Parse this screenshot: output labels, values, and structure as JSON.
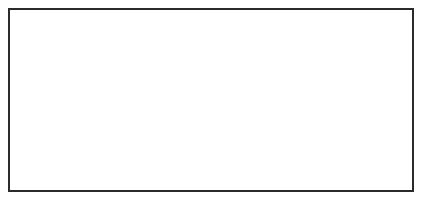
{
  "figure": {
    "background_color": "#ffffff",
    "frame": {
      "border_color": "#2b2b2b",
      "border_width_px": 2,
      "x": 8,
      "y": 8,
      "width": 406,
      "height": 184
    },
    "outline_color": "#2e2e2e",
    "fill_color": "#ffffff",
    "notch_color": "#1a1a1a",
    "label_color": "#3a3a3a",
    "panel_count": 4,
    "panels": [
      {
        "id": "panel-a",
        "label": "(a)",
        "label_x": 17,
        "label_y": 47,
        "upper_shape": {
          "name": "upper-valve-outline",
          "path": "M 63 41 C 68 45, 70 53, 70 62 C 70 72, 68 82, 66 88 C 64 93, 62 95, 59 97 C 56 99, 52 101, 49 103 C 46 105, 44 106, 42 106 C 39.5 106, 38.5 103.5, 39.5 99 C 40.5 94, 42.5 88, 44.5 81 C 46.5 74, 48.5 66, 51 58 C 53.5 50, 56 44, 58.5 41.5 C 60 40, 61.5 39.8, 63 41 Z"
        },
        "lower_shape": {
          "name": "lower-valve-outline",
          "path": "M 55 99 C 57.5 99.5, 60 101.5, 63 104.5 C 66 107.5, 69 111, 72 115 C 75 119, 78 124, 80.5 129 C 83 134, 85 139, 86 144 C 87 149, 87 153, 85.5 156 C 84 159, 81.5 159.5, 79.5 157.5 C 77 155, 74.5 150.5, 71.5 144.5 C 68.5 138.5, 65 131, 62 124 C 59 117, 56.5 110.5, 55 106 C 53.8 102.3, 53.5 99.6, 55 99 Z"
        },
        "notch": {
          "name": "hinge-notch",
          "path": "M 51 99.5 C 53.5 99, 55.5 100, 56.5 102 C 57.3 103.6, 56.6 105, 54.8 105.3 C 52.8 105.6, 51 104.4, 50.3 102.5 C 49.8 101, 50 99.8, 51 99.5 Z"
        }
      },
      {
        "id": "panel-b",
        "label": "(b)",
        "label_x": 118,
        "label_y": 46,
        "upper_shape": {
          "name": "upper-valve-outline",
          "path": "M 164 47 C 168 51, 169.5 58, 169 66 C 168.5 75, 166 84, 163.5 90 C 161.5 95, 159.5 98, 157 100.5 C 154 103.5, 150 106, 146 108.5 C 142.5 110.8, 139.5 112, 137 112 C 134.5 112, 133.5 109.5, 134.5 105.5 C 135.5 101, 138 95, 141 88 C 144.5 80, 148.5 71, 152.5 63 C 156.5 55, 160 49.5, 162 47.5 C 163 46.5, 163.6 46.4, 164 47 Z"
        },
        "lower_shape": {
          "name": "lower-valve-outline",
          "path": "M 149 105 C 152 105, 155 107, 158.5 110 C 162 113, 165.5 117, 169 121.5 C 172.5 126, 176 131, 178.5 136 C 181 141, 182.5 146, 182.5 150.5 C 182.5 155, 181 157.5, 179 157 C 176.5 156.5, 173.5 152.5, 170 146.5 C 166.5 140.5, 162.5 133, 159 126 C 155.5 119, 152 112.5, 150 108 C 148.6 105.1, 148 105, 149 105 Z"
        },
        "notch": {
          "name": "hinge-notch",
          "path": "M 141 104 C 145 102.7, 148.5 103.5, 150.5 105.5 C 152 107, 151.5 108.8, 149 109.8 C 146 111, 142.5 110.2, 140.5 108 C 139 106.4, 139.3 104.6, 141 104 Z"
        }
      },
      {
        "id": "panel-c",
        "label": "(c)",
        "label_x": 213,
        "label_y": 46,
        "upper_shape": {
          "name": "upper-valve-outline",
          "path": "M 251 46 C 255 48, 257.5 54, 258.5 62 C 259.5 71, 259 81, 257.5 89 C 256.5 95, 255 100, 253.5 104 C 252 108, 250.5 112, 249 114.5 C 247.5 117, 246 118, 244.5 117.5 C 243 117, 242 114.5, 241.5 110 C 241 104.5, 241 97, 241.5 88.5 C 242 79, 243 68.5, 244.5 60 C 246 51.5, 248 46.5, 249.5 45.8 C 250.3 45.4, 250.7 45.7, 251 46 Z"
        },
        "lower_shape": {
          "name": "lower-valve-outline",
          "path": "M 260 100 C 263 100.5, 266 103, 269 106.5 C 272 110, 275.5 114.5, 278.5 119.5 C 281.5 124.5, 284.5 130, 286.5 135.5 C 288.5 141, 290 146, 290 150.5 C 290 155, 288.5 157.5, 286.5 157 C 284 156.5, 281 152.5, 277.5 146.5 C 274 140.5, 270 132.5, 266.5 125 C 263 117.5, 260.5 110.5, 259.5 105.5 C 258.7 101.6, 259 100, 260 100 Z"
        },
        "notch": {
          "name": "hinge-notch",
          "path": "M 253 98 C 256 97.5, 258.5 99, 259.5 101.5 C 260.5 104, 259.5 107.5, 257.5 110.5 C 255.8 113, 254 113.5, 253 111.5 C 252 109.5, 251.5 105.5, 251.8 102 C 252 99.5, 252.3 98.2, 253 98 Z"
        }
      },
      {
        "id": "panel-d",
        "label": "(d)",
        "label_x": 344,
        "label_y": 44,
        "upper_shape": {
          "name": "upper-valve-outline",
          "path": "M 386 40 C 389 43, 389.5 49, 388 56 C 386.5 63, 383.5 70, 380.5 76.5 C 378.5 81, 376.5 85, 375 88 C 373.5 91, 372 93, 370 94.5 C 367 96.5, 363 98, 359.5 99.5 C 356 101, 353 102.5, 351 103.5 C 349 104.5, 348 104.5, 347.5 103 C 347 101.5, 348 98.5, 350 94.5 C 352.5 89.5, 356 83, 360 75.5 C 364.5 67, 369.5 58, 374.5 51 C 379.5 44, 383 40.3, 385 39.8 C 385.6 39.6, 385.8 39.7, 386 40 Z"
        },
        "lower_shape": {
          "name": "lower-valve-outline",
          "path": "M 339 95.5 C 341.5 95, 344 96.5, 347 99.5 C 350 102.5, 353.5 107, 357 112 C 360.5 117, 364 122.5, 366.5 128 C 369 133.5, 370.5 138.5, 370.5 143.5 C 370.5 148.5, 369 152, 366.5 152.5 C 364 153, 360.5 150, 356.5 144.5 C 352.5 139, 348 131.5, 344.5 124 C 341 116.5, 338.5 109.5, 337.5 104.5 C 336.7 100.2, 337 96, 339 95.5 Z"
        },
        "notch": {
          "name": "hinge-notch",
          "path": "M 357 93 C 361 91.5, 365 91.8, 367 93.5 C 368.5 94.8, 367.5 96.8, 364.5 98.5 C 361.5 100.2, 357.5 101, 355.5 99.8 C 353.8 98.8, 354.2 94.2, 357 93 Z"
        }
      }
    ]
  }
}
